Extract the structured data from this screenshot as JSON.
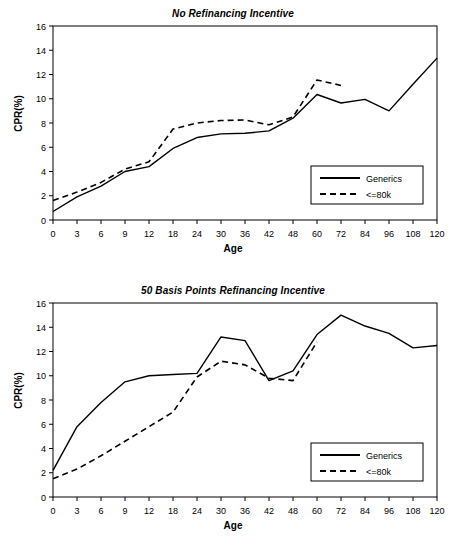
{
  "figure": {
    "axis_label_x": "Age",
    "axis_label_y": "CPR(%)",
    "series_names": [
      "Generics",
      "<=80k"
    ],
    "line_color": "#000000",
    "frame_color": "#000000",
    "background": "#ffffff"
  },
  "chart_data": [
    {
      "type": "line",
      "title": "No Refinancing Incentive",
      "xlabel": "Age",
      "ylabel": "CPR(%)",
      "categories": [
        "0",
        "3",
        "6",
        "9",
        "12",
        "18",
        "24",
        "30",
        "36",
        "42",
        "48",
        "60",
        "72",
        "84",
        "96",
        "108",
        "120"
      ],
      "ylim": [
        0,
        16
      ],
      "yticks": [
        0,
        2,
        4,
        6,
        8,
        10,
        12,
        14,
        16
      ],
      "grid": false,
      "legend_position": "lower right",
      "series": [
        {
          "name": "Generics",
          "style": "solid",
          "values": [
            0.7,
            1.9,
            2.8,
            4.0,
            4.4,
            5.9,
            6.8,
            7.1,
            7.15,
            7.35,
            8.4,
            10.35,
            9.65,
            9.95,
            9.0,
            11.2,
            13.35
          ]
        },
        {
          "name": "<=80k",
          "style": "dashed",
          "values": [
            1.6,
            2.3,
            3.1,
            4.2,
            4.8,
            7.5,
            8.0,
            8.2,
            8.25,
            7.85,
            8.5,
            11.55,
            11.1,
            null,
            null,
            null,
            null
          ]
        }
      ]
    },
    {
      "type": "line",
      "title": "50 Basis Points Refinancing Incentive",
      "xlabel": "Age",
      "ylabel": "CPR(%)",
      "categories": [
        "0",
        "3",
        "6",
        "9",
        "12",
        "18",
        "24",
        "30",
        "36",
        "42",
        "48",
        "60",
        "72",
        "84",
        "96",
        "108",
        "120"
      ],
      "ylim": [
        0,
        16
      ],
      "yticks": [
        0,
        2,
        4,
        6,
        8,
        10,
        12,
        14,
        16
      ],
      "grid": false,
      "legend_position": "lower right",
      "series": [
        {
          "name": "Generics",
          "style": "solid",
          "values": [
            2.2,
            5.8,
            7.8,
            9.5,
            10.0,
            10.1,
            10.2,
            13.2,
            12.9,
            9.6,
            10.4,
            13.4,
            15.0,
            14.1,
            13.5,
            12.3,
            12.5
          ]
        },
        {
          "name": "<=80k",
          "style": "dashed",
          "values": [
            1.5,
            2.3,
            3.4,
            4.6,
            5.8,
            7.0,
            9.9,
            11.2,
            10.9,
            9.8,
            9.6,
            12.8,
            null,
            null,
            null,
            null,
            null
          ]
        }
      ]
    }
  ],
  "legends": [
    {
      "items": [
        {
          "label": "Generics",
          "style": "solid"
        },
        {
          "label": "<=80k",
          "style": "dashed"
        }
      ]
    },
    {
      "items": [
        {
          "label": "Generics",
          "style": "solid"
        },
        {
          "label": "<=80k",
          "style": "dashed"
        }
      ]
    }
  ]
}
